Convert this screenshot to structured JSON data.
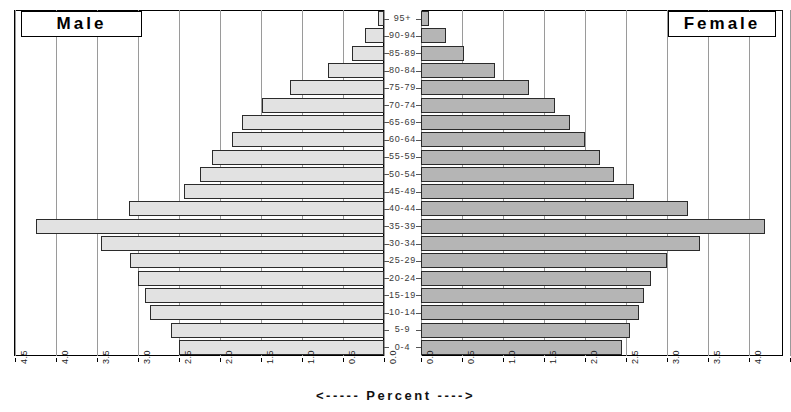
{
  "legend": {
    "male_label": "Male",
    "female_label": "Female"
  },
  "caption": "<----- Percent ---->",
  "axis": {
    "left_ticks": [
      "4.5",
      "4.0",
      "3.5",
      "3.0",
      "2.5",
      "2.0",
      "1.5",
      "1.0",
      "0.5",
      "0.0"
    ],
    "right_ticks": [
      "0.0",
      "0.5",
      "1.0",
      "1.5",
      "2.0",
      "2.5",
      "3.0",
      "3.5",
      "4.0",
      "4.5"
    ]
  },
  "colors": {
    "male_bar": "#e2e2e2",
    "female_bar": "#b5b5b5",
    "bar_outline": "#2b2b2b",
    "gridline": "#9a9a9a",
    "axis": "#000000"
  },
  "chart_data": {
    "type": "bar",
    "title": "",
    "subtitle": "",
    "xlabel": "<----- Percent ---->",
    "ylabel": "",
    "orientation": "horizontal",
    "layout": "population-pyramid",
    "grid": true,
    "legend_position": "top-corners",
    "xlim_left": [
      4.5,
      0.0
    ],
    "xlim_right": [
      0.0,
      4.5
    ],
    "xtick_step": 0.5,
    "categories": [
      "95+",
      "90-94",
      "85-89",
      "80-84",
      "75-79",
      "70-74",
      "65-69",
      "60-64",
      "55-59",
      "50-54",
      "45-49",
      "40-44",
      "35-39",
      "30-34",
      "25-29",
      "20-24",
      "15-19",
      "10-14",
      "5-9",
      "0-4"
    ],
    "series": [
      {
        "name": "Male",
        "side": "left",
        "values": [
          0.07,
          0.23,
          0.39,
          0.68,
          1.15,
          1.49,
          1.73,
          1.85,
          2.1,
          2.24,
          2.44,
          3.11,
          4.25,
          3.45,
          3.1,
          3.0,
          2.91,
          2.85,
          2.6,
          2.5
        ]
      },
      {
        "name": "Female",
        "side": "right",
        "values": [
          0.1,
          0.3,
          0.52,
          0.9,
          1.32,
          1.64,
          1.82,
          2.0,
          2.18,
          2.35,
          2.6,
          3.25,
          4.2,
          3.4,
          3.0,
          2.8,
          2.72,
          2.66,
          2.55,
          2.45
        ]
      }
    ]
  }
}
